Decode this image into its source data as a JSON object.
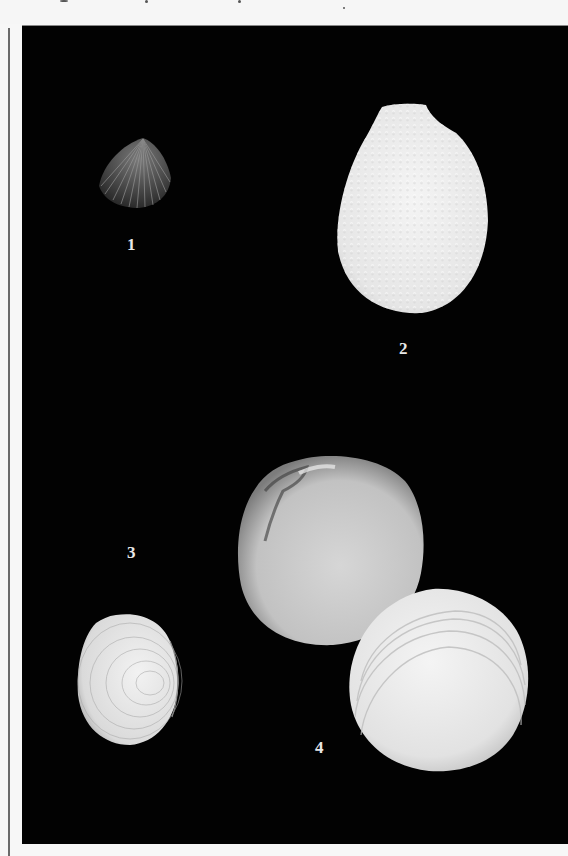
{
  "plate": {
    "background": "#020202",
    "figures": [
      {
        "label": "1",
        "description": "small dark ribbed bivalve shell"
      },
      {
        "label": "2",
        "description": "white ovate shell with beaded radial ribs"
      },
      {
        "label": "3",
        "description": "white ovate shell with concentric and radial sculpture, side view"
      },
      {
        "label": "4",
        "description": "pair of rounded clam valves, interior and exterior views"
      }
    ]
  }
}
